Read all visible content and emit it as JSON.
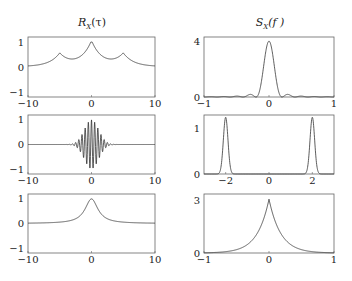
{
  "titles": {
    "left": "R_X(τ)",
    "right": "S_X(f)"
  },
  "chart_data": [
    {
      "type": "line",
      "panel": "row1-left",
      "title": "R_X(τ)",
      "xlim": [
        -10,
        10
      ],
      "ylim": [
        -1.2,
        1.2
      ],
      "xticks": [
        "-10",
        "0",
        "10"
      ],
      "yticks": [
        "-1",
        "0",
        "1"
      ],
      "description": "Cusp peaks: 1.0 at τ=0, ~0.5 at τ=±5, decaying to 0 at ±10",
      "x": [
        -10,
        -7.5,
        -5,
        -2.5,
        0,
        2.5,
        5,
        7.5,
        10
      ],
      "values": [
        0.02,
        0.12,
        0.5,
        0.12,
        1.0,
        0.12,
        0.5,
        0.12,
        0.02
      ]
    },
    {
      "type": "line",
      "panel": "row1-right",
      "title": "S_X(f)",
      "xlim": [
        -1,
        1
      ],
      "ylim": [
        0,
        4.3
      ],
      "xticks": [
        "-1",
        "0",
        "1"
      ],
      "yticks": [
        "0",
        "4"
      ],
      "description": "Sinc-squared-like spectrum: main lobe 4 at f=0, side lobes ~1.6 at ±0.2, ~0.55 at ±0.4, ~0.3 at ±0.6, ~0.15 at ±0.8",
      "x": [
        -0.8,
        -0.6,
        -0.4,
        -0.2,
        0,
        0.2,
        0.4,
        0.6,
        0.8
      ],
      "values": [
        0.15,
        0.3,
        0.55,
        1.6,
        4.0,
        1.6,
        0.55,
        0.3,
        0.15
      ]
    },
    {
      "type": "line",
      "panel": "row2-left",
      "xlim": [
        -10,
        10
      ],
      "ylim": [
        -1.2,
        1.2
      ],
      "xticks": [
        "-10",
        "0",
        "10"
      ],
      "yticks": [
        "-1",
        "0",
        "1"
      ],
      "description": "Gaussian-modulated cosine, amplitude 1 at τ=0, oscillating, envelope vanishing by |τ|≈3"
    },
    {
      "type": "line",
      "panel": "row2-right",
      "xlim": [
        -3,
        3
      ],
      "ylim": [
        0,
        1.3
      ],
      "xticks": [
        "-2",
        "0",
        "2"
      ],
      "yticks": [
        "0",
        "1"
      ],
      "description": "Two Gaussian peaks of height ~1.25 centered at f=-2 and f=2",
      "x": [
        -2,
        2
      ],
      "values": [
        1.25,
        1.25
      ]
    },
    {
      "type": "line",
      "panel": "row3-left",
      "xlim": [
        -10,
        10
      ],
      "ylim": [
        -1.2,
        1.2
      ],
      "xticks": [
        "-10",
        "0",
        "10"
      ],
      "yticks": [
        "-1",
        "0",
        "1"
      ],
      "description": "Smooth peak of 1 at τ=0 decaying to 0 (Lorentzian-like)"
    },
    {
      "type": "line",
      "panel": "row3-right",
      "xlim": [
        -1,
        1
      ],
      "ylim": [
        0,
        3.4
      ],
      "xticks": [
        "-1",
        "0",
        "1"
      ],
      "yticks": [
        "0",
        "3"
      ],
      "description": "Two-sided exponential cusp with peak ~3.1 at f=0 decaying to 0 at ±1"
    }
  ]
}
